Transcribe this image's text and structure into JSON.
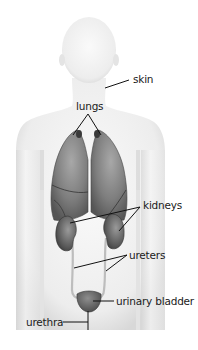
{
  "diagram": {
    "labels": {
      "skin": "skin",
      "lungs": "lungs",
      "kidneys": "kidneys",
      "ureters": "ureters",
      "urinary_bladder": "urinary bladder",
      "urethra": "urethra"
    },
    "colors": {
      "background": "#ffffff",
      "body": "#e6e6e6",
      "body_edge": "#d2d2d2",
      "organ_dark": "#4d4d4d",
      "organ_mid": "#7a7a7a",
      "organ_light": "#9c9c9c",
      "leader_line": "#111111",
      "text": "#1a1a1a"
    }
  }
}
